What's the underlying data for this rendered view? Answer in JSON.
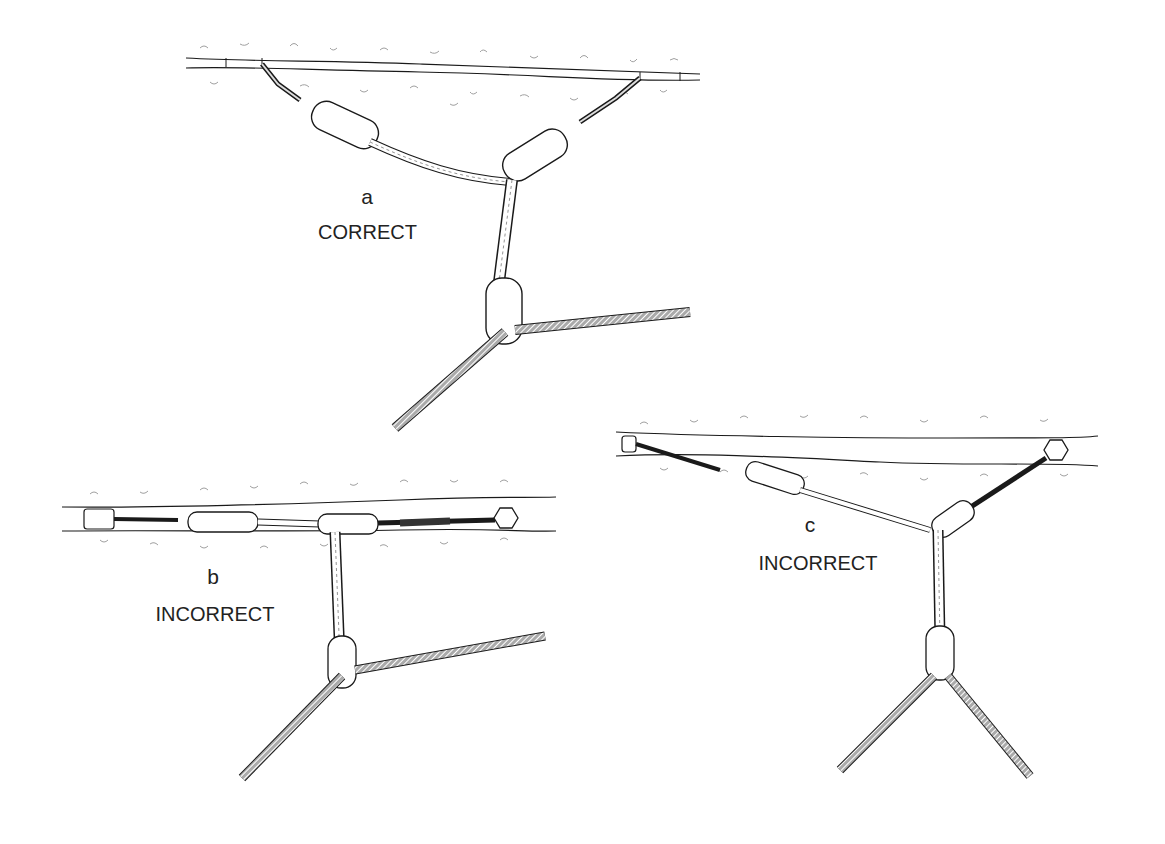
{
  "figure": {
    "panels": [
      {
        "id": "a",
        "letter": "a",
        "verdict": "CORRECT"
      },
      {
        "id": "b",
        "letter": "b",
        "verdict": "INCORRECT"
      },
      {
        "id": "c",
        "letter": "c",
        "verdict": "INCORRECT"
      }
    ]
  },
  "colors": {
    "ink": "#1a1a1a",
    "rock_texture": "#9a9a9a",
    "rope_fill": "#7a7a7a",
    "background": "#ffffff"
  }
}
